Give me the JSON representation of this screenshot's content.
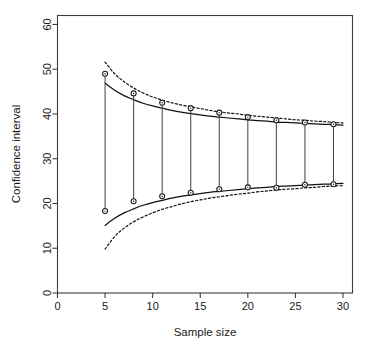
{
  "chart_data": {
    "type": "line",
    "title": "",
    "xlabel": "Sample size",
    "ylabel": "Confidence interval",
    "xlim": [
      0,
      31
    ],
    "ylim": [
      0,
      62
    ],
    "grid": false,
    "legend": "none",
    "xticks": [
      0,
      5,
      10,
      15,
      20,
      25,
      30
    ],
    "yticks": [
      0,
      10,
      20,
      30,
      40,
      50,
      60
    ],
    "xtick_labels": [
      "0",
      "5",
      "10",
      "15",
      "20",
      "25",
      "30"
    ],
    "ytick_labels": [
      "0",
      "10",
      "20",
      "30",
      "40",
      "50",
      "60"
    ],
    "series": [
      {
        "name": "upper bound (theoretical, solid)",
        "style": "solid",
        "x": [
          5,
          6,
          7,
          8,
          9,
          10,
          11,
          12,
          13,
          14,
          15,
          16,
          17,
          18,
          19,
          20,
          21,
          22,
          23,
          24,
          25,
          26,
          27,
          28,
          29,
          30
        ],
        "values": [
          46.9,
          45.3,
          44.1,
          43.2,
          42.4,
          41.8,
          41.3,
          40.8,
          40.4,
          40.1,
          39.8,
          39.5,
          39.3,
          39.1,
          38.9,
          38.7,
          38.5,
          38.4,
          38.2,
          38.1,
          38.0,
          37.9,
          37.8,
          37.7,
          37.6,
          37.5
        ]
      },
      {
        "name": "lower bound (theoretical, solid)",
        "style": "solid",
        "x": [
          5,
          6,
          7,
          8,
          9,
          10,
          11,
          12,
          13,
          14,
          15,
          16,
          17,
          18,
          19,
          20,
          21,
          22,
          23,
          24,
          25,
          26,
          27,
          28,
          29,
          30
        ],
        "values": [
          15.1,
          16.7,
          17.9,
          18.8,
          19.6,
          20.2,
          20.7,
          21.2,
          21.6,
          21.9,
          22.2,
          22.5,
          22.7,
          22.9,
          23.1,
          23.3,
          23.5,
          23.6,
          23.8,
          23.9,
          24.0,
          24.1,
          24.2,
          24.3,
          24.4,
          24.5
        ]
      },
      {
        "name": "upper bound (empirical, dashed)",
        "style": "dashed",
        "x": [
          5,
          6,
          7,
          8,
          9,
          10,
          11,
          12,
          13,
          14,
          15,
          16,
          17,
          18,
          19,
          20,
          21,
          22,
          23,
          24,
          25,
          26,
          27,
          28,
          29,
          30
        ],
        "values": [
          51.6,
          49.0,
          47.2,
          45.8,
          44.7,
          43.8,
          43.1,
          42.5,
          42.0,
          41.6,
          41.2,
          40.8,
          40.5,
          40.2,
          40.0,
          39.7,
          39.5,
          39.3,
          39.1,
          38.9,
          38.7,
          38.6,
          38.4,
          38.3,
          38.1,
          38.0
        ]
      },
      {
        "name": "lower bound (empirical, dashed)",
        "style": "dashed",
        "x": [
          5,
          6,
          7,
          8,
          9,
          10,
          11,
          12,
          13,
          14,
          15,
          16,
          17,
          18,
          19,
          20,
          21,
          22,
          23,
          24,
          25,
          26,
          27,
          28,
          29,
          30
        ],
        "values": [
          9.8,
          12.6,
          14.5,
          15.9,
          17.0,
          17.9,
          18.7,
          19.3,
          19.9,
          20.4,
          20.8,
          21.2,
          21.5,
          21.8,
          22.1,
          22.3,
          22.6,
          22.8,
          23.0,
          23.2,
          23.3,
          23.5,
          23.6,
          23.8,
          23.9,
          24.0
        ]
      }
    ],
    "interval_segments": {
      "name": "observed confidence intervals",
      "x": [
        5,
        8,
        11,
        14,
        17,
        20,
        23,
        26,
        29
      ],
      "upper": [
        49.0,
        44.6,
        42.5,
        41.3,
        40.3,
        39.3,
        38.6,
        38.1,
        37.7
      ],
      "lower": [
        18.3,
        20.5,
        21.6,
        22.4,
        23.2,
        23.6,
        23.5,
        24.2,
        24.3
      ],
      "marker": "open-circle"
    }
  },
  "axes": {
    "x_axis_title": "Sample size",
    "y_axis_title": "Confidence interval"
  }
}
